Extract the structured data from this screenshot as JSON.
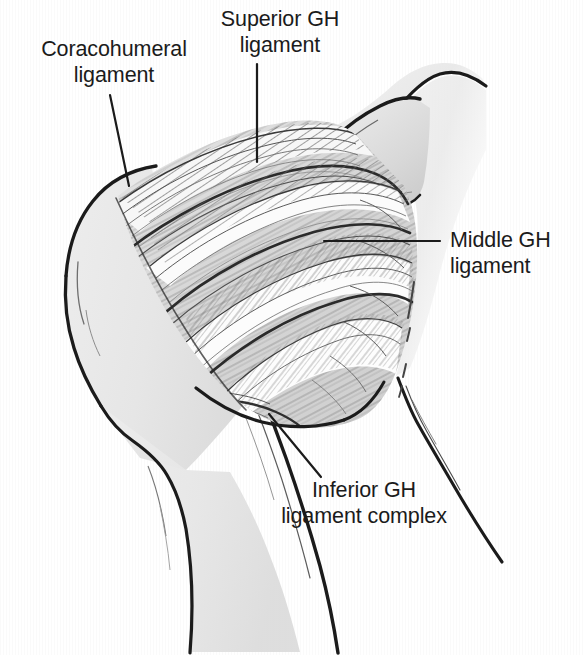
{
  "figure": {
    "type": "anatomical-line-illustration",
    "background_color": "#ffffff",
    "ink_color": "#1b1b1b",
    "bone_fill_color": "#e8e8e8",
    "capsule_fill_color": "#d9d9d9",
    "hatch_color": "#555555"
  },
  "labels": {
    "coracohumeral": "Coracohumeral\nligament",
    "superior_gh": "Superior GH\nligament",
    "middle_gh": "Middle GH\nligament",
    "inferior_gh": "Inferior GH\nligament complex"
  },
  "structures": {
    "humeral_head": "humeral-head",
    "humeral_shaft": "humeral-shaft",
    "coracoid_process": "coracoid-process",
    "scapula_border": "scapula-border",
    "joint_capsule": "joint-capsule",
    "coracohumeral_band": "coracohumeral-ligament-band",
    "superior_band": "superior-gh-ligament-band",
    "middle_band": "middle-gh-ligament-band",
    "inferior_band": "inferior-gh-ligament-complex-band"
  },
  "leader_lines": [
    {
      "name": "leader-coracohumeral",
      "from": [
        110,
        95
      ],
      "to": [
        129,
        186
      ]
    },
    {
      "name": "leader-superior-gh",
      "from": [
        257,
        64
      ],
      "to": [
        257,
        162
      ]
    },
    {
      "name": "leader-middle-gh",
      "from": [
        440,
        241
      ],
      "to": [
        324,
        241
      ]
    },
    {
      "name": "leader-inferior-gh",
      "from": [
        321,
        477
      ],
      "to": [
        269,
        414
      ]
    }
  ]
}
